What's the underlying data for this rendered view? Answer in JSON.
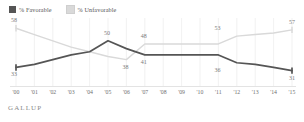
{
  "legend": {
    "items": [
      {
        "label": "% Favorable",
        "color": "#555555",
        "icon": "square-swatch-icon"
      },
      {
        "label": "% Unfavorable",
        "color": "#d9d9d9",
        "icon": "square-swatch-icon"
      }
    ]
  },
  "source": {
    "label": "GALLUP"
  },
  "chart_data": {
    "type": "line",
    "title": "",
    "subtitle": "",
    "xlabel": "",
    "ylabel": "",
    "ylim": [
      25,
      62
    ],
    "grid": "vertical",
    "legend_position": "top-left",
    "categories": [
      "'00",
      "'01",
      "'02",
      "'03",
      "'04",
      "'05",
      "'06",
      "'07",
      "'08",
      "'09",
      "'10",
      "'11",
      "'12",
      "'13",
      "'14",
      "'15"
    ],
    "series": [
      {
        "name": "% Favorable",
        "color": "#555555",
        "values": [
          33,
          35,
          38,
          41,
          43,
          50,
          45,
          41,
          41,
          41,
          41,
          41,
          36,
          35,
          33,
          31
        ],
        "point_labels": [
          {
            "category": "'00",
            "value": 33,
            "text": "33",
            "position": "below"
          },
          {
            "category": "'05",
            "value": 50,
            "text": "50",
            "position": "above"
          },
          {
            "category": "'07",
            "value": 41,
            "text": "41",
            "position": "below"
          },
          {
            "category": "'11",
            "value": 36,
            "text": "36",
            "position": "below"
          },
          {
            "category": "'15",
            "value": 31,
            "text": "31",
            "position": "below"
          }
        ]
      },
      {
        "name": "% Unfavorable",
        "color": "#d9d9d9",
        "values": [
          58,
          54,
          50,
          46,
          43,
          40,
          38,
          48,
          48,
          48,
          48,
          48,
          53,
          54,
          55,
          57
        ],
        "point_labels": [
          {
            "category": "'00",
            "value": 58,
            "text": "58",
            "position": "above"
          },
          {
            "category": "'06",
            "value": 38,
            "text": "38",
            "position": "below"
          },
          {
            "category": "'07",
            "value": 48,
            "text": "48",
            "position": "above"
          },
          {
            "category": "'11",
            "value": 53,
            "text": "53",
            "position": "above"
          },
          {
            "category": "'15",
            "value": 57,
            "text": "57",
            "position": "above"
          }
        ]
      }
    ]
  }
}
